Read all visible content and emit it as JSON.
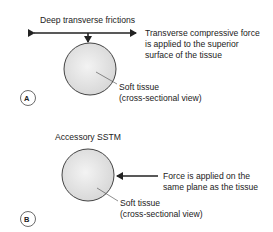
{
  "panel_a": {
    "label": "A",
    "technique": "Deep transverse frictions",
    "force_note": [
      "Transverse compressive force",
      "is applied to the superior",
      "surface of the tissue"
    ],
    "tissue_label": [
      "Soft tissue",
      "(cross-sectional view)"
    ]
  },
  "panel_b": {
    "label": "B",
    "technique": "Accessory SSTM",
    "force_note": [
      "Force is applied on the",
      "same plane as the tissue"
    ],
    "tissue_label": [
      "Soft tissue",
      "(cross-sectional view)"
    ]
  },
  "colors": {
    "line": "#222222",
    "tissue_fill": "#e6e6e6",
    "tissue_edge": "#444444"
  }
}
